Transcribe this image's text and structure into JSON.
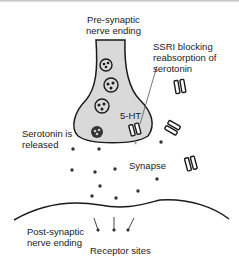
{
  "diagram": {
    "labels": {
      "presynaptic": "Pre-synaptic\nnerve ending",
      "ssri": "SSRI blocking\nreabsorption of\nserotonin",
      "five_ht": "5-HT",
      "serotonin_released": "Serotonin is\nreleased",
      "synapse": "Synapse",
      "postsynaptic": "Post-synaptic\nnerve ending",
      "receptor_sites": "Receptor sites"
    },
    "colors": {
      "neuron_fill": "#d9d9d9",
      "outline": "#1a1a1a",
      "dot": "#333333"
    }
  }
}
